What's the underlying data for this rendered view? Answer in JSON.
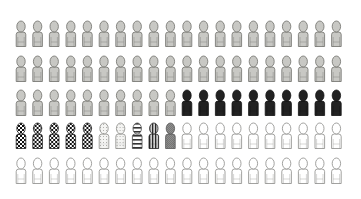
{
  "chart_data": {
    "type": "pictograph",
    "title": "",
    "layout": {
      "columns": 20,
      "rows": 5
    },
    "total": 100,
    "series": [
      {
        "name": "gray",
        "count": 50,
        "fill": "#c8c8c4",
        "stroke": "#6e6e6a",
        "pattern": "solid"
      },
      {
        "name": "black",
        "count": 10,
        "fill": "#222222",
        "stroke": "#111111",
        "pattern": "solid"
      },
      {
        "name": "checkered",
        "count": 5,
        "fill": "#ffffff",
        "stroke": "#222222",
        "pattern": "checker"
      },
      {
        "name": "dotted",
        "count": 2,
        "fill": "#f2f2f0",
        "stroke": "#8a8a86",
        "pattern": "dots"
      },
      {
        "name": "h-striped",
        "count": 1,
        "fill": "#ffffff",
        "stroke": "#444444",
        "pattern": "hstripes"
      },
      {
        "name": "v-striped",
        "count": 1,
        "fill": "#ffffff",
        "stroke": "#222222",
        "pattern": "vstripes"
      },
      {
        "name": "crosshatch",
        "count": 1,
        "fill": "#9a9a98",
        "stroke": "#555555",
        "pattern": "crosshatch"
      },
      {
        "name": "white",
        "count": 30,
        "fill": "#ffffff",
        "stroke": "#8a8a88",
        "pattern": "solid"
      }
    ],
    "row_order": [
      [
        "gray",
        20
      ],
      [
        "gray",
        20
      ],
      [
        "gray",
        10
      ],
      [
        "black",
        10
      ],
      [
        "checkered",
        5
      ],
      [
        "dotted",
        2
      ],
      [
        "h-striped",
        1
      ],
      [
        "v-striped",
        1
      ],
      [
        "crosshatch",
        1
      ],
      [
        "white",
        10
      ],
      [
        "white",
        20
      ]
    ]
  }
}
